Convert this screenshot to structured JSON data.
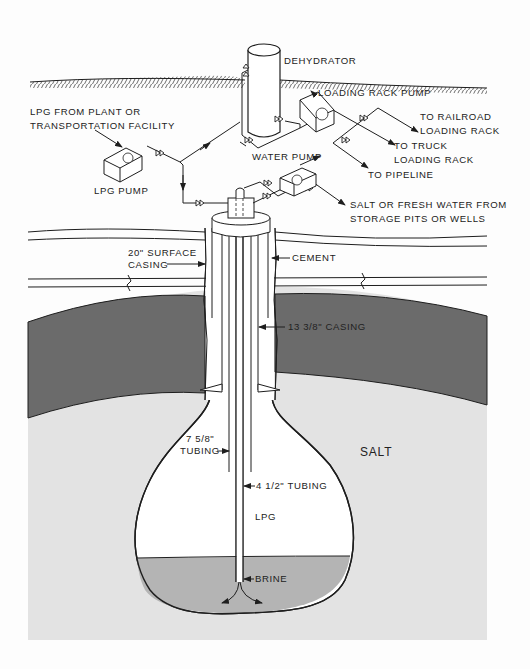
{
  "diagram": {
    "surface_labels": {
      "dehydrator": "DEHYDRATOR",
      "loading_rack_pump": "LOADING RACK PUMP",
      "lpg_source_line1": "LPG FROM PLANT OR",
      "lpg_source_line2": "TRANSPORTATION FACILITY",
      "lpg_pump": "LPG PUMP",
      "water_pump": "WATER PUMP",
      "to_railroad_line1": "TO RAILROAD",
      "to_railroad_line2": "LOADING RACK",
      "to_truck_line1": "TO TRUCK",
      "to_truck_line2": "LOADING RACK",
      "to_pipeline": "TO PIPELINE",
      "water_source_line1": "SALT OR FRESH WATER FROM",
      "water_source_line2": "STORAGE PITS OR WELLS"
    },
    "well_labels": {
      "surface_casing_line1": "20\" SURFACE",
      "surface_casing_line2": "CASING",
      "cement": "CEMENT",
      "casing_13": "13 3/8\" CASING",
      "tubing_7_line1": "7 5/8\"",
      "tubing_7_line2": "TUBING",
      "tubing_4": "4 1/2\" TUBING"
    },
    "cavern_labels": {
      "salt": "SALT",
      "lpg": "LPG",
      "brine": "BRINE"
    },
    "colors": {
      "background": "#fdfdfd",
      "caprock_band": "#6b6b6b",
      "salt": "#e3e3e3",
      "brine": "#b4b4b4",
      "lpg_space": "#ffffff",
      "line": "#1e1e1e"
    }
  }
}
